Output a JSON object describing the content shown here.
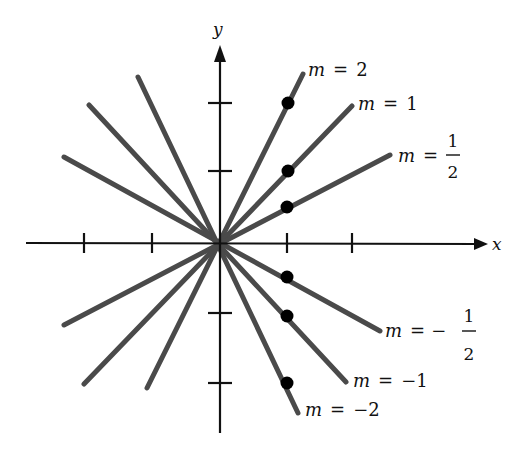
{
  "figure": {
    "axes": {
      "x_label": "x",
      "y_label": "y",
      "origin": [
        220,
        243
      ],
      "unit_px": 68,
      "x_ticks": [
        -2,
        -1,
        1,
        2
      ],
      "y_ticks": [
        -2,
        -1,
        1,
        2
      ]
    },
    "colors": {
      "line": "#4a4a4a",
      "axis": "#111111",
      "dot": "#000000"
    },
    "lines": [
      {
        "slope": "2",
        "label_m": "m",
        "label_eq": "=",
        "label_value": "2",
        "marked_point": [
          1,
          2
        ]
      },
      {
        "slope": "1",
        "label_m": "m",
        "label_eq": "=",
        "label_value": "1",
        "marked_point": [
          1,
          1
        ]
      },
      {
        "slope": "1/2",
        "label_m": "m",
        "label_eq": "=",
        "label_num": "1",
        "label_den": "2",
        "marked_point": [
          1,
          0.5
        ]
      },
      {
        "slope": "-1/2",
        "label_m": "m",
        "label_eq": "=",
        "label_sign": "−",
        "label_num": "1",
        "label_den": "2",
        "marked_point": [
          1,
          -0.5
        ]
      },
      {
        "slope": "-1",
        "label_m": "m",
        "label_eq": "=",
        "label_value": "−1",
        "marked_point": [
          1,
          -1
        ]
      },
      {
        "slope": "-2",
        "label_m": "m",
        "label_eq": "=",
        "label_value": "−2",
        "marked_point": [
          1,
          -2
        ]
      }
    ]
  }
}
